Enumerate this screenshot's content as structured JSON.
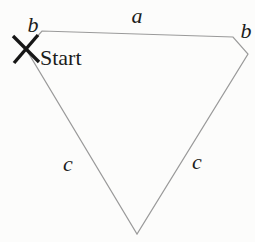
{
  "diagram": {
    "labels": {
      "side_a": "a",
      "side_b_left": "b",
      "side_b_right": "b",
      "side_c_left": "c",
      "side_c_right": "c",
      "start": "Start"
    },
    "marker": {
      "glyph": "X",
      "meaning": "start position"
    },
    "shape": {
      "type": "closed-polygon",
      "vertices": [
        [
          26,
          49
        ],
        [
          42,
          31
        ],
        [
          233,
          37
        ],
        [
          248,
          54
        ],
        [
          137,
          234
        ]
      ],
      "marker_segments": [
        [
          13,
          36,
          39,
          62
        ],
        [
          38,
          35,
          14,
          63
        ]
      ]
    },
    "colors": {
      "outline": "#9a9a9a",
      "marker": "#161616",
      "text": "#1c1c1c",
      "background": "#fcfcfb"
    }
  }
}
